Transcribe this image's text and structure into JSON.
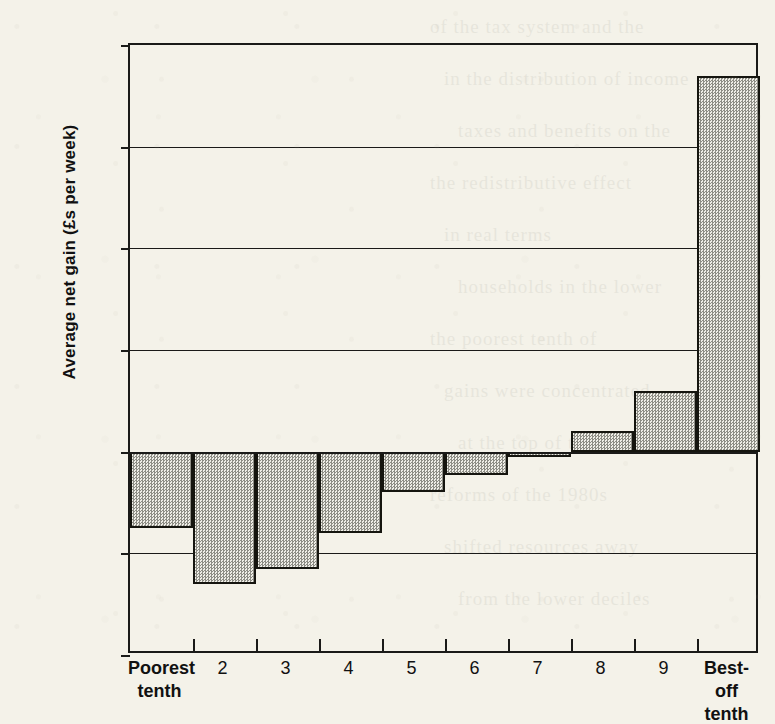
{
  "chart_data": {
    "type": "bar",
    "title": "",
    "subtitle": "",
    "xlabel": "",
    "ylabel": "Average net gain (£s per week)",
    "categories": [
      "Poorest tenth",
      "2",
      "3",
      "4",
      "5",
      "6",
      "7",
      "8",
      "9",
      "Best-off tenth"
    ],
    "category_lines": [
      [
        "Poorest",
        "tenth"
      ],
      [
        "2",
        ""
      ],
      [
        "3",
        ""
      ],
      [
        "4",
        ""
      ],
      [
        "5",
        ""
      ],
      [
        "6",
        ""
      ],
      [
        "7",
        ""
      ],
      [
        "8",
        ""
      ],
      [
        "9",
        ""
      ],
      [
        "Best-off",
        "tenth"
      ]
    ],
    "values": [
      -7.5,
      -13.0,
      -11.5,
      -8.0,
      -4.0,
      -2.3,
      -0.5,
      2.0,
      6.0,
      37.0
    ],
    "ylim": [
      -20,
      40
    ],
    "y_ticks": [
      40,
      30,
      20,
      10,
      0,
      -10,
      -20
    ],
    "y_tick_labels": [
      "40",
      "30",
      "20",
      "10",
      "0",
      "− 10",
      "− 20"
    ],
    "grid": true,
    "grid_axis": "y",
    "legend": "none",
    "bar_fill": "#d8d6cd",
    "bar_pattern": "checkered-dither-50",
    "bar_edge_color": "#15150f",
    "axis_color": "#1a1a18",
    "background_color": "#f4f2e9",
    "units": "£s per week"
  },
  "page": {
    "bleed_text": [
      "of the tax system and the",
      "in the distribution of income",
      "taxes and benefits on the",
      "the redistributive effect",
      "in real terms",
      "households in the lower",
      "the poorest tenth of",
      "gains were concentrated",
      "at the top of the scale",
      "reforms of the 1980s",
      "shifted resources away",
      "from the lower deciles"
    ]
  },
  "icons": {}
}
